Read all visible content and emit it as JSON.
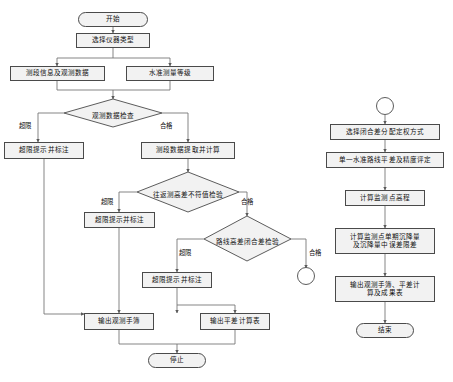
{
  "diagram": {
    "style": {
      "node_fill": "#f2f2f2",
      "node_stroke": "#4a4a4a",
      "line_color": "#6f6f6f",
      "text_color": "#111111",
      "background": "#ffffff"
    },
    "left_flow": {
      "start": {
        "label": "开始",
        "shape": "terminator"
      },
      "nodes": [
        {
          "id": "select_instrument",
          "label": "选择仪器类型",
          "shape": "process"
        },
        {
          "id": "section_info",
          "label": "测段信息及观测数据",
          "shape": "process"
        },
        {
          "id": "level_grade",
          "label": "水准测量等级",
          "shape": "process"
        },
        {
          "id": "check_obs_data",
          "label": "观测数据检查",
          "shape": "decision"
        },
        {
          "id": "over_limit_note_1",
          "label": "超限提示并标注",
          "shape": "process"
        },
        {
          "id": "extract_calc",
          "label": "测段数据提取并计算",
          "shape": "process"
        },
        {
          "id": "check_round_trip",
          "label": "往返测高差不符值检验",
          "shape": "decision"
        },
        {
          "id": "over_limit_note_2",
          "label": "超限提示并标注",
          "shape": "process"
        },
        {
          "id": "check_closure",
          "label": "路线高差闭合差检验",
          "shape": "decision"
        },
        {
          "id": "over_limit_note_3",
          "label": "超限提示并标注",
          "shape": "process"
        },
        {
          "id": "output_field_book",
          "label": "输出观测手簿",
          "shape": "process"
        },
        {
          "id": "output_adjustment_table",
          "label": "输出平差计算表",
          "shape": "process"
        }
      ],
      "end": {
        "label": "停止",
        "shape": "terminator"
      },
      "branch_labels": [
        {
          "id": "branch-over-limit-1",
          "label": "超限"
        },
        {
          "id": "branch-pass-1",
          "label": "合格"
        },
        {
          "id": "branch-over-limit-2",
          "label": "超限"
        },
        {
          "id": "branch-pass-2",
          "label": "合格"
        },
        {
          "id": "branch-over-limit-3",
          "label": "超限"
        },
        {
          "id": "branch-pass-3",
          "label": "合格"
        }
      ],
      "connector": {
        "id": "offpage-connector-a",
        "label": "",
        "shape": "circle"
      }
    },
    "right_flow": {
      "connector": {
        "id": "offpage-connector-a-in",
        "label": "",
        "shape": "circle"
      },
      "nodes": [
        {
          "id": "select_weight_method",
          "label": "选择闭合差分配定权方式",
          "shape": "process"
        },
        {
          "id": "single_route_adjust",
          "label": "单一水准路线平差及精度评定",
          "shape": "process"
        },
        {
          "id": "calc_point_elevation",
          "label": "计算监测点高程",
          "shape": "process"
        },
        {
          "id": "calc_settlement",
          "label": "计算监测点单期沉降量\n及沉降量中误差限差",
          "shape": "process"
        },
        {
          "id": "output_results",
          "label": "输出观测手簿、平差计\n算及成果表",
          "shape": "process"
        }
      ],
      "end": {
        "label": "结束",
        "shape": "terminator"
      }
    }
  }
}
